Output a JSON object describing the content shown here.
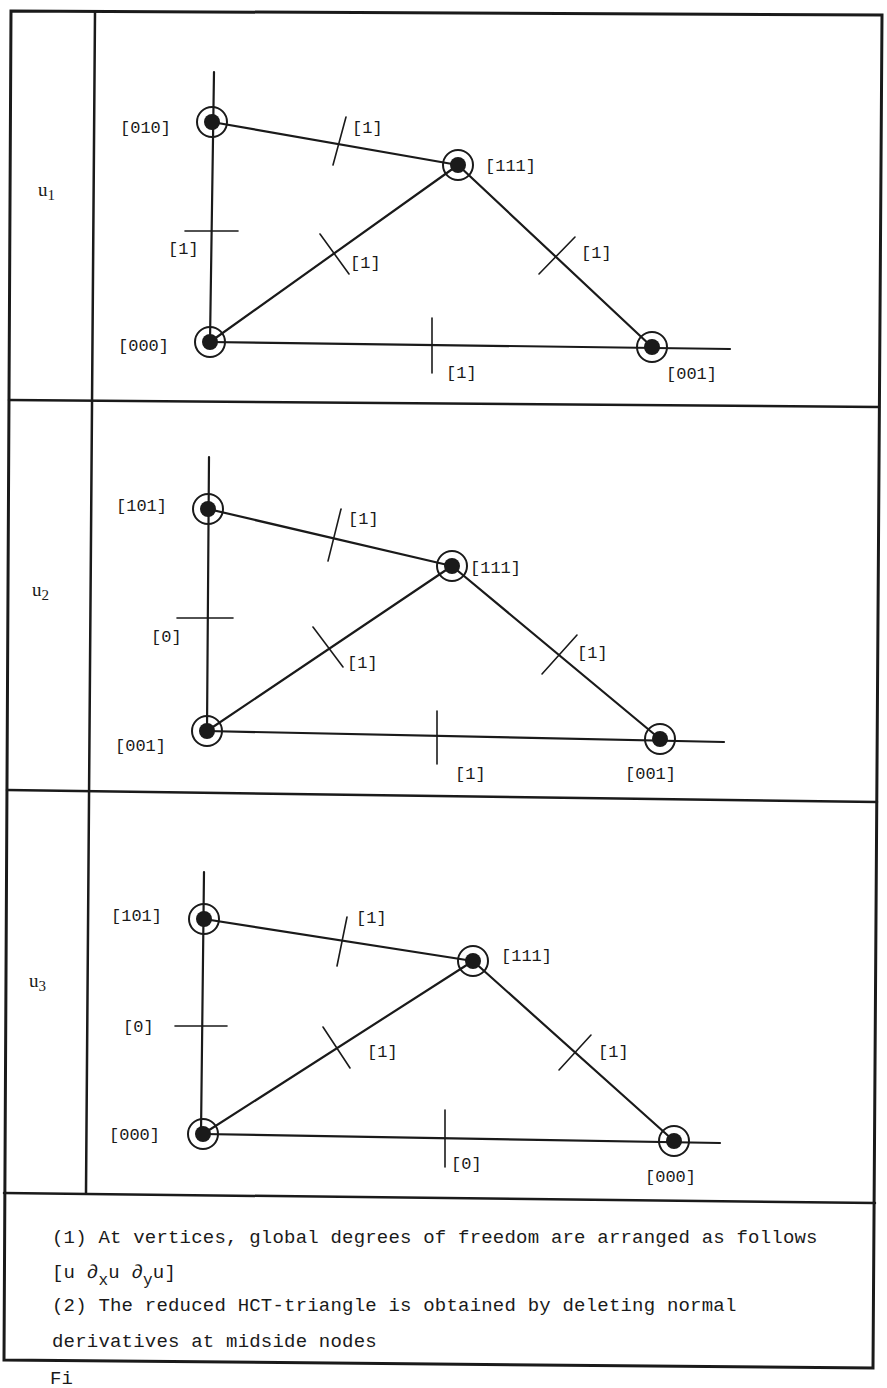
{
  "table": {
    "rows": [
      {
        "label": "u",
        "subscript": "1",
        "nodes": [
          {
            "id": "top-left",
            "x": 212,
            "y": 122,
            "label": "[010]"
          },
          {
            "id": "apex",
            "x": 458,
            "y": 165,
            "label": "[111]"
          },
          {
            "id": "origin",
            "x": 210,
            "y": 342,
            "label": "[000]"
          },
          {
            "id": "right",
            "x": 652,
            "y": 347,
            "label": "[001]"
          }
        ],
        "midside": [
          {
            "edge": "top-left-apex",
            "label": "[1]"
          },
          {
            "edge": "origin-top-left",
            "label": "[1]"
          },
          {
            "edge": "origin-apex",
            "label": "[1]"
          },
          {
            "edge": "apex-right",
            "label": "[1]"
          },
          {
            "edge": "origin-right",
            "label": "[1]"
          }
        ]
      },
      {
        "label": "u",
        "subscript": "2",
        "nodes": [
          {
            "id": "top-left",
            "x": 208,
            "y": 509,
            "label": "[101]"
          },
          {
            "id": "apex",
            "x": 452,
            "y": 566,
            "label": "[111]"
          },
          {
            "id": "origin",
            "x": 207,
            "y": 731,
            "label": "[001]"
          },
          {
            "id": "right",
            "x": 660,
            "y": 739,
            "label": "[001]"
          }
        ],
        "midside": [
          {
            "edge": "top-left-apex",
            "label": "[1]"
          },
          {
            "edge": "origin-top-left",
            "label": "[0]"
          },
          {
            "edge": "origin-apex",
            "label": "[1]"
          },
          {
            "edge": "apex-right",
            "label": "[1]"
          },
          {
            "edge": "origin-right",
            "label": "[1]"
          }
        ]
      },
      {
        "label": "u",
        "subscript": "3",
        "nodes": [
          {
            "id": "top-left",
            "x": 204,
            "y": 919,
            "label": "[101]"
          },
          {
            "id": "apex",
            "x": 473,
            "y": 961,
            "label": "[111]"
          },
          {
            "id": "origin",
            "x": 203,
            "y": 1134,
            "label": "[000]"
          },
          {
            "id": "right",
            "x": 674,
            "y": 1141,
            "label": "[000]"
          }
        ],
        "midside": [
          {
            "edge": "top-left-apex",
            "label": "[1]"
          },
          {
            "edge": "origin-top-left",
            "label": "[0]"
          },
          {
            "edge": "origin-apex",
            "label": "[1]"
          },
          {
            "edge": "apex-right",
            "label": "[1]"
          },
          {
            "edge": "origin-right",
            "label": "[0]"
          }
        ]
      }
    ]
  },
  "notes": {
    "note1": "(1) At vertices, global degrees of freedom are arranged as follows",
    "note1_formula": {
      "open": "[u ∂",
      "sub_x": "x",
      "mid": "u ∂",
      "sub_y": "y",
      "close": "u]"
    },
    "note2_line1": "(2) The reduced HCT-triangle is obtained by deleting normal",
    "note2_line2": "derivatives at midside nodes"
  },
  "caption_fragment": "Fi"
}
